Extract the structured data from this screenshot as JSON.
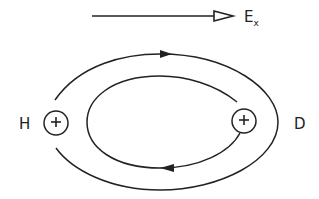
{
  "field": {
    "label": "E",
    "subscript": "x",
    "arrow": {
      "x1": 92,
      "y1": 16,
      "x2": 233,
      "y2": 16
    }
  },
  "nuclei": [
    {
      "id": "H",
      "label": "H",
      "charge": "+",
      "cx": 56,
      "cy": 123,
      "r": 12,
      "label_x": 24,
      "label_y": 128
    },
    {
      "id": "D",
      "label": "D",
      "charge": "+",
      "cx": 244,
      "cy": 121,
      "r": 12,
      "label_x": 299,
      "label_y": 128
    }
  ],
  "trajectories": {
    "outer": {
      "direction": "clockwise",
      "arrow_at": "top"
    },
    "inner": {
      "direction": "clockwise",
      "arrow_at": "bottom"
    }
  },
  "colors": {
    "stroke": "#222222",
    "background": "#ffffff"
  }
}
